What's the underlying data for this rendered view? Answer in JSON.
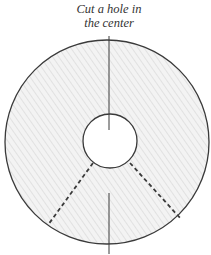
{
  "caption": {
    "line1": "Cut a hole in",
    "line2": "the center"
  },
  "diagram": {
    "outer_circle": {
      "cx": 107,
      "cy": 142,
      "r": 102
    },
    "hole": {
      "cx": 110,
      "cy": 141,
      "r": 27
    },
    "top_line": {
      "x1": 109,
      "y1": 36,
      "x2": 109,
      "y2": 130
    },
    "bottom_line": {
      "x1": 109,
      "y1": 193,
      "x2": 109,
      "y2": 254
    },
    "dashed_left": {
      "x1": 93,
      "y1": 163,
      "x2": 48,
      "y2": 225
    },
    "dashed_right": {
      "x1": 130,
      "y1": 163,
      "x2": 181,
      "y2": 219
    },
    "colors": {
      "stroke": "#3a3a3a",
      "fill": "#efefef",
      "hatch": "#c8c8c8"
    }
  }
}
